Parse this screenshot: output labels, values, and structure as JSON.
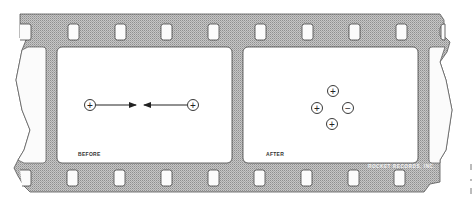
{
  "figure": {
    "colors": {
      "film": "#b9b9b9",
      "film_pattern_dark": "#9a9a9a",
      "frame": "#ffffff",
      "outline": "#444444",
      "ink": "#222222"
    },
    "frames": [
      {
        "label": "BEFORE",
        "charges": [
          {
            "sign": "+",
            "x": 90,
            "y": 105
          },
          {
            "sign": "+",
            "x": 193,
            "y": 105
          }
        ],
        "arrows": [
          {
            "from": [
              96,
              105
            ],
            "to": [
              136,
              105
            ],
            "direction": "right"
          },
          {
            "from": [
              187,
              105
            ],
            "to": [
              144,
              105
            ],
            "direction": "left"
          }
        ]
      },
      {
        "label": "AFTER",
        "charges": [
          {
            "sign": "+",
            "x": 333,
            "y": 91
          },
          {
            "sign": "+",
            "x": 317,
            "y": 108
          },
          {
            "sign": "−",
            "x": 348,
            "y": 108
          },
          {
            "sign": "+",
            "x": 332,
            "y": 124
          }
        ],
        "arrows": []
      }
    ],
    "credit": "ROCKET RECORDS, INC."
  }
}
